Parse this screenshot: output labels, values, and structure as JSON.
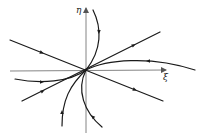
{
  "diagram": {
    "type": "phase-portrait",
    "axes": {
      "x_label": "ξ",
      "y_label": "η"
    },
    "colors": {
      "stroke": "#1a1a1a",
      "axis": "#555555",
      "background": "#ffffff"
    },
    "origin": [
      86,
      70
    ],
    "trajectories": [
      {
        "name": "straight-line-negative-slope",
        "kind": "line"
      },
      {
        "name": "straight-line-positive-slope",
        "kind": "line"
      },
      {
        "name": "curve-top",
        "kind": "curve"
      },
      {
        "name": "curve-right",
        "kind": "curve"
      },
      {
        "name": "curve-left",
        "kind": "curve"
      },
      {
        "name": "curve-bottom-left",
        "kind": "curve"
      },
      {
        "name": "curve-bottom",
        "kind": "curve"
      }
    ]
  }
}
